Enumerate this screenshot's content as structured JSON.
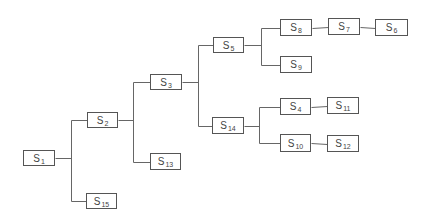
{
  "diagram": {
    "type": "tree",
    "nodes": [
      {
        "id": "S1",
        "label": "S",
        "sub": "1",
        "x": 23,
        "y": 150,
        "w": 32,
        "h": 16
      },
      {
        "id": "S2",
        "label": "S",
        "sub": "2",
        "x": 87,
        "y": 112,
        "w": 31,
        "h": 16
      },
      {
        "id": "S15",
        "label": "S",
        "sub": "15",
        "x": 86,
        "y": 193,
        "w": 31,
        "h": 16
      },
      {
        "id": "S3",
        "label": "S",
        "sub": "3",
        "x": 150,
        "y": 74,
        "w": 32,
        "h": 16
      },
      {
        "id": "S13",
        "label": "S",
        "sub": "13",
        "x": 150,
        "y": 153,
        "w": 31,
        "h": 17
      },
      {
        "id": "S5",
        "label": "S",
        "sub": "5",
        "x": 213,
        "y": 37,
        "w": 31,
        "h": 16
      },
      {
        "id": "S14",
        "label": "S",
        "sub": "14",
        "x": 212,
        "y": 117,
        "w": 32,
        "h": 17
      },
      {
        "id": "S8",
        "label": "S",
        "sub": "8",
        "x": 280,
        "y": 19,
        "w": 32,
        "h": 17
      },
      {
        "id": "S7",
        "label": "S",
        "sub": "7",
        "x": 328,
        "y": 18,
        "w": 32,
        "h": 17
      },
      {
        "id": "S6",
        "label": "S",
        "sub": "6",
        "x": 375,
        "y": 19,
        "w": 33,
        "h": 17
      },
      {
        "id": "S9",
        "label": "S",
        "sub": "9",
        "x": 280,
        "y": 56,
        "w": 32,
        "h": 17
      },
      {
        "id": "S4",
        "label": "S",
        "sub": "4",
        "x": 280,
        "y": 98,
        "w": 31,
        "h": 17
      },
      {
        "id": "S11",
        "label": "S",
        "sub": "11",
        "x": 327,
        "y": 97,
        "w": 32,
        "h": 17
      },
      {
        "id": "S10",
        "label": "S",
        "sub": "10",
        "x": 280,
        "y": 134,
        "w": 31,
        "h": 18
      },
      {
        "id": "S12",
        "label": "S",
        "sub": "12",
        "x": 327,
        "y": 135,
        "w": 32,
        "h": 17
      }
    ],
    "edges": [
      [
        "S1",
        "S2"
      ],
      [
        "S1",
        "S15"
      ],
      [
        "S2",
        "S3"
      ],
      [
        "S2",
        "S13"
      ],
      [
        "S3",
        "S5"
      ],
      [
        "S3",
        "S14"
      ],
      [
        "S5",
        "S8"
      ],
      [
        "S5",
        "S9"
      ],
      [
        "S8",
        "S7"
      ],
      [
        "S7",
        "S6"
      ],
      [
        "S14",
        "S4"
      ],
      [
        "S14",
        "S10"
      ],
      [
        "S4",
        "S11"
      ],
      [
        "S10",
        "S12"
      ]
    ],
    "branch_x": {
      "S1": 71,
      "S2": 133,
      "S3": 198,
      "S5": 261,
      "S14": 259
    },
    "colors": {
      "line": "#666666",
      "border": "#555555",
      "text": "#444444",
      "background": "#ffffff"
    }
  }
}
